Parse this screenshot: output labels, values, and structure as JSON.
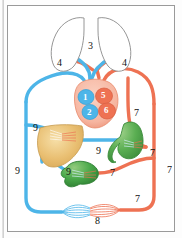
{
  "figure": {
    "background": "#ffffff",
    "frame_color": "#9a9a9a",
    "colors": {
      "oxygenated_red": "#ee7253",
      "deoxygenated_blue": "#4db5e8",
      "heart_tissue": "#f6b5a0",
      "liver": "#e9bf72",
      "stomach": "#5aae52",
      "intestine": "#49a84a",
      "lung_outline": "#8a8a8a",
      "label_text": "#111111",
      "chamber_label_text": "#ffffff"
    }
  },
  "organs": [
    {
      "name": "left-lung",
      "label": "",
      "color": "#ffffff"
    },
    {
      "name": "right-lung",
      "label": "",
      "color": "#ffffff"
    },
    {
      "name": "heart",
      "label": "",
      "color": "#f6b5a0"
    },
    {
      "name": "liver",
      "label": "",
      "color": "#e9bf72"
    },
    {
      "name": "stomach",
      "label": "",
      "color": "#5aae52"
    },
    {
      "name": "intestine",
      "label": "",
      "color": "#49a84a"
    },
    {
      "name": "body-capillary-bed",
      "label": "",
      "color": "#cfe9f7"
    }
  ],
  "labels": [
    {
      "id": "l3",
      "text": "3",
      "x": 88,
      "y": 46,
      "style": "dark",
      "refers_to": "pulmonary-capillaries"
    },
    {
      "id": "l4a",
      "text": "4",
      "x": 57,
      "y": 63,
      "style": "dark",
      "refers_to": "left-lung-vessels"
    },
    {
      "id": "l4b",
      "text": "4",
      "x": 122,
      "y": 63,
      "style": "dark",
      "refers_to": "right-lung-vessels"
    },
    {
      "id": "l1",
      "text": "1",
      "x": 83,
      "y": 94,
      "style": "white",
      "refers_to": "right-atrium"
    },
    {
      "id": "l5",
      "text": "5",
      "x": 101,
      "y": 93,
      "style": "white",
      "refers_to": "left-atrium"
    },
    {
      "id": "l2",
      "text": "2",
      "x": 87,
      "y": 110,
      "style": "white",
      "refers_to": "right-ventricle"
    },
    {
      "id": "l6",
      "text": "6",
      "x": 104,
      "y": 109,
      "style": "white",
      "refers_to": "left-ventricle"
    },
    {
      "id": "l7a",
      "text": "7",
      "x": 134,
      "y": 113,
      "style": "dark",
      "refers_to": "systemic-artery"
    },
    {
      "id": "l7b",
      "text": "7",
      "x": 151,
      "y": 153,
      "style": "dark",
      "refers_to": "gastric-artery"
    },
    {
      "id": "l7c",
      "text": "7",
      "x": 168,
      "y": 170,
      "style": "dark",
      "refers_to": "systemic-artery-trunk"
    },
    {
      "id": "l7d",
      "text": "7",
      "x": 110,
      "y": 173,
      "style": "dark",
      "refers_to": "intestinal-artery"
    },
    {
      "id": "l7e",
      "text": "7",
      "x": 135,
      "y": 199,
      "style": "dark",
      "refers_to": "lower-body-artery"
    },
    {
      "id": "l8",
      "text": "8",
      "x": 96,
      "y": 219,
      "style": "dark",
      "refers_to": "body-capillary-bed"
    },
    {
      "id": "l9a",
      "text": "9",
      "x": 33,
      "y": 128,
      "style": "dark",
      "refers_to": "hepatic-vein"
    },
    {
      "id": "l9b",
      "text": "9",
      "x": 96,
      "y": 151,
      "style": "dark",
      "refers_to": "gastric-vein"
    },
    {
      "id": "l9c",
      "text": "9",
      "x": 16,
      "y": 171,
      "style": "dark",
      "refers_to": "vena-cava"
    },
    {
      "id": "l9d",
      "text": "9",
      "x": 66,
      "y": 172,
      "style": "dark",
      "refers_to": "hepatic-portal-vein"
    }
  ],
  "legend_note": ""
}
